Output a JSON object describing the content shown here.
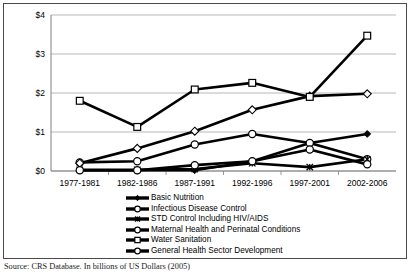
{
  "chart_data": {
    "type": "line",
    "title": "",
    "subtitle": "",
    "xlabel": "",
    "ylabel": "",
    "ylim": [
      0,
      4
    ],
    "ytick_labels": [
      "$0",
      "$1",
      "$2",
      "$3",
      "$4"
    ],
    "ytick_values": [
      0,
      1,
      2,
      3,
      4
    ],
    "grid": true,
    "legend_position": "bottom",
    "categories": [
      "1977-1981",
      "1982-1986",
      "1987-1991",
      "1992-1996",
      "1997-2001",
      "2002-2006"
    ],
    "series": [
      {
        "name": "Basic Nutrition",
        "marker": "filled-diamond",
        "values": [
          0.02,
          0.02,
          0.02,
          0.25,
          0.72,
          0.95
        ]
      },
      {
        "name": "Infectious Disease Control",
        "marker": "open-circle",
        "values": [
          0.22,
          0.25,
          0.68,
          0.95,
          0.72,
          0.3
        ]
      },
      {
        "name": "STD Control Including HIV/AIDS",
        "marker": "asterisk",
        "values": [
          0.03,
          0.03,
          0.05,
          0.2,
          0.1,
          0.3
        ]
      },
      {
        "name": "Maternal Health and Perinatal Conditions",
        "marker": "open-diamond",
        "values": [
          0.2,
          0.58,
          1.02,
          1.57,
          1.92,
          1.98
        ]
      },
      {
        "name": "Water Sanitation",
        "marker": "open-square",
        "values": [
          1.8,
          1.13,
          2.09,
          2.26,
          1.9,
          3.47
        ]
      },
      {
        "name": "General Health Sector Development",
        "marker": "open-circle",
        "values": [
          0.02,
          0.02,
          0.15,
          0.25,
          0.55,
          0.17
        ]
      }
    ]
  },
  "legend": {
    "items": [
      {
        "label": "Basic Nutrition",
        "marker": "filled-diamond"
      },
      {
        "label": "Infectious Disease Control",
        "marker": "open-circle"
      },
      {
        "label": "STD Control Including HIV/AIDS",
        "marker": "asterisk"
      },
      {
        "label": "Maternal Health and Perinatal Conditions",
        "marker": "open-circle"
      },
      {
        "label": "Water Sanitation",
        "marker": "open-square"
      },
      {
        "label": "General Health Sector Development",
        "marker": "open-circle"
      }
    ]
  },
  "source_note": "Source: CRS Database.  In billions of US Dollars (2005)",
  "colors": {
    "line": "#000000",
    "grid": "#a6a6a6",
    "axis": "#808080",
    "border": "#4a4a4a",
    "background": "#ffffff"
  }
}
